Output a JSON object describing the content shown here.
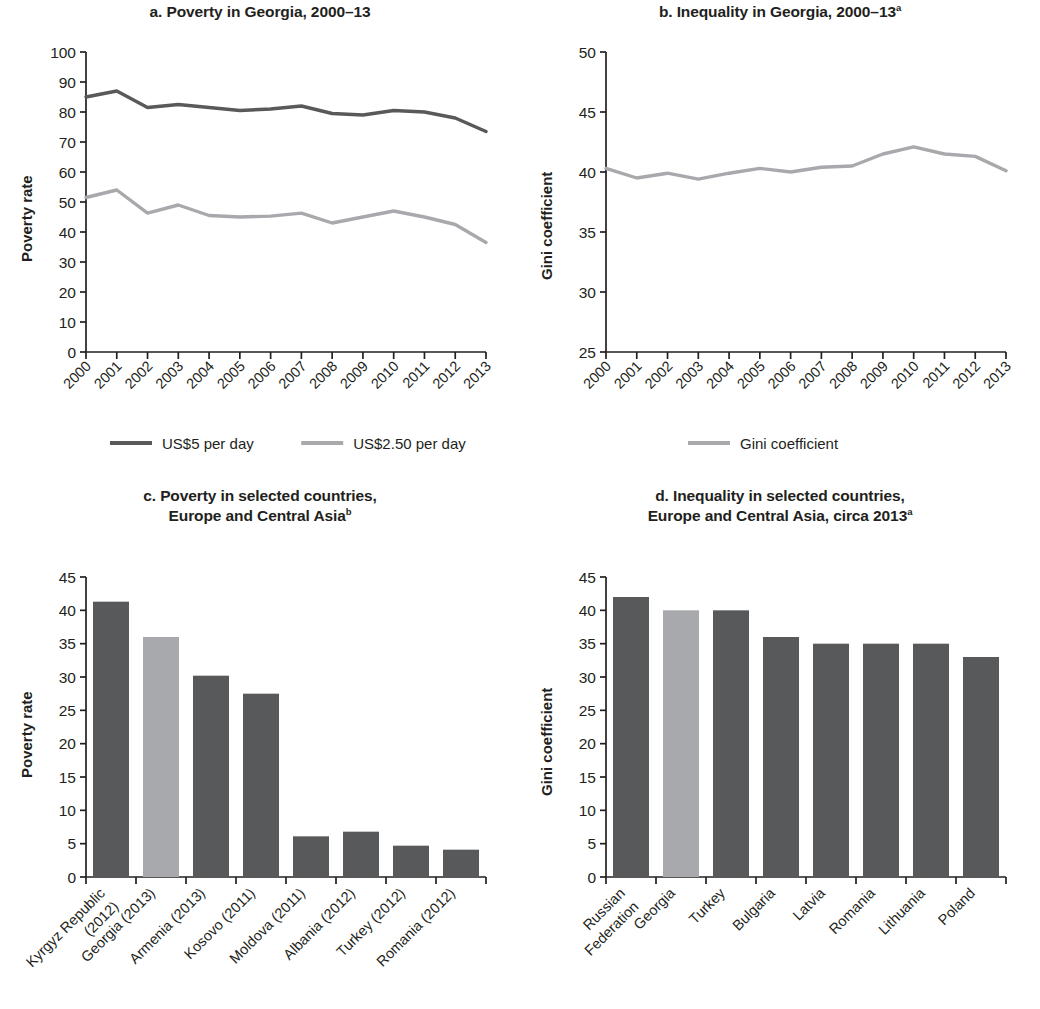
{
  "figure": {
    "panels": [
      "a",
      "b",
      "c",
      "d"
    ],
    "colors": {
      "dark_series": "#58595b",
      "light_series": "#a7a9ac",
      "axis": "#231f20",
      "background": "#ffffff"
    }
  },
  "panel_a": {
    "title_prefix": "a. ",
    "title": "Poverty in Georgia, 2000–13",
    "ylabel": "Poverty rate",
    "legend": [
      {
        "label": "US$5 per day",
        "color": "#58595b"
      },
      {
        "label": "US$2.50 per day",
        "color": "#a7a9ac"
      }
    ]
  },
  "panel_b": {
    "title_prefix": "b. ",
    "title": "Inequality in Georgia, 2000–13",
    "title_sup": "a",
    "ylabel": "Gini coefficient",
    "legend": [
      {
        "label": "Gini coefficient",
        "color": "#a7a9ac"
      }
    ]
  },
  "panel_c": {
    "title_prefix": "c. ",
    "title_line1": "Poverty in selected countries,",
    "title_line2": "Europe and Central Asia",
    "title_sup": "b",
    "ylabel": "Poverty rate"
  },
  "panel_d": {
    "title_prefix": "d. ",
    "title_line1": "Inequality in selected countries,",
    "title_line2": "Europe and Central Asia, circa 2013",
    "title_sup": "a",
    "ylabel": "Gini coefficient"
  },
  "chart_data": [
    {
      "id": "a",
      "type": "line",
      "title": "a. Poverty in Georgia, 2000–13",
      "xlabel": "",
      "ylabel": "Poverty rate",
      "ylim": [
        0,
        100
      ],
      "yticks": [
        0,
        10,
        20,
        30,
        40,
        50,
        60,
        70,
        80,
        90,
        100
      ],
      "grid": false,
      "legend_position": "bottom",
      "x": [
        "2000",
        "2001",
        "2002",
        "2003",
        "2004",
        "2005",
        "2006",
        "2007",
        "2008",
        "2009",
        "2010",
        "2011",
        "2012",
        "2013"
      ],
      "series": [
        {
          "name": "US$5 per day",
          "color": "#58595b",
          "values": [
            85.0,
            87.0,
            81.5,
            82.5,
            81.5,
            80.5,
            81.0,
            82.0,
            79.5,
            79.0,
            80.5,
            80.0,
            78.0,
            73.5
          ]
        },
        {
          "name": "US$2.50 per day",
          "color": "#a7a9ac",
          "values": [
            51.5,
            54.0,
            46.3,
            49.0,
            45.5,
            45.0,
            45.3,
            46.3,
            43.0,
            45.0,
            47.0,
            45.0,
            42.5,
            36.5
          ]
        }
      ]
    },
    {
      "id": "b",
      "type": "line",
      "title": "b. Inequality in Georgia, 2000–13",
      "xlabel": "",
      "ylabel": "Gini coefficient",
      "ylim": [
        25,
        50
      ],
      "yticks": [
        25,
        30,
        35,
        40,
        45,
        50
      ],
      "grid": false,
      "legend_position": "bottom",
      "x": [
        "2000",
        "2001",
        "2002",
        "2003",
        "2004",
        "2005",
        "2006",
        "2007",
        "2008",
        "2009",
        "2010",
        "2011",
        "2012",
        "2013"
      ],
      "series": [
        {
          "name": "Gini coefficient",
          "color": "#a7a9ac",
          "values": [
            40.3,
            39.5,
            39.9,
            39.4,
            39.9,
            40.3,
            40.0,
            40.4,
            40.5,
            41.5,
            42.1,
            41.5,
            41.3,
            40.1
          ]
        }
      ]
    },
    {
      "id": "c",
      "type": "bar",
      "title": "c. Poverty in selected countries, Europe and Central Asia",
      "xlabel": "",
      "ylabel": "Poverty rate",
      "ylim": [
        0,
        45
      ],
      "yticks": [
        0,
        5,
        10,
        15,
        20,
        25,
        30,
        35,
        40,
        45
      ],
      "grid": false,
      "categories": [
        "Kyrgyz Republic (2012)",
        "Georgia (2013)",
        "Armenia (2013)",
        "Kosovo (2011)",
        "Moldova (2011)",
        "Albania (2012)",
        "Turkey (2012)",
        "Romania (2012)"
      ],
      "category_lines": [
        [
          "Kyrgyz Republic",
          "(2012)"
        ],
        [
          "Georgia (2013)"
        ],
        [
          "Armenia (2013)"
        ],
        [
          "Kosovo (2011)"
        ],
        [
          "Moldova (2011)"
        ],
        [
          "Albania (2012)"
        ],
        [
          "Turkey (2012)"
        ],
        [
          "Romania (2012)"
        ]
      ],
      "values": [
        41.3,
        36.0,
        30.2,
        27.5,
        6.1,
        6.8,
        4.7,
        4.1
      ],
      "bar_colors": [
        "#58595b",
        "#a7a9ac",
        "#58595b",
        "#58595b",
        "#58595b",
        "#58595b",
        "#58595b",
        "#58595b"
      ],
      "highlight_index": 1
    },
    {
      "id": "d",
      "type": "bar",
      "title": "d. Inequality in selected countries, Europe and Central Asia, circa 2013",
      "xlabel": "",
      "ylabel": "Gini coefficient",
      "ylim": [
        0,
        45
      ],
      "yticks": [
        0,
        5,
        10,
        15,
        20,
        25,
        30,
        35,
        40,
        45
      ],
      "grid": false,
      "categories": [
        "Russian Federation",
        "Georgia",
        "Turkey",
        "Bulgaria",
        "Latvia",
        "Romania",
        "Lithuania",
        "Poland"
      ],
      "category_lines": [
        [
          "Russian",
          "Federation"
        ],
        [
          "Georgia"
        ],
        [
          "Turkey"
        ],
        [
          "Bulgaria"
        ],
        [
          "Latvia"
        ],
        [
          "Romania"
        ],
        [
          "Lithuania"
        ],
        [
          "Poland"
        ]
      ],
      "values": [
        42,
        40,
        40,
        36,
        35,
        35,
        35,
        33
      ],
      "bar_colors": [
        "#58595b",
        "#a7a9ac",
        "#58595b",
        "#58595b",
        "#58595b",
        "#58595b",
        "#58595b",
        "#58595b"
      ],
      "highlight_index": 1
    }
  ]
}
